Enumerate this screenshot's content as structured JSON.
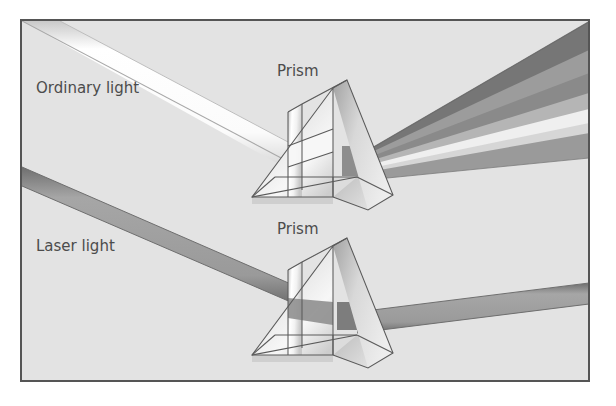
{
  "figure": {
    "title_visible": false,
    "domain_kind": "diagram",
    "background_color": "#ffffff",
    "panel_color": "#e3e3e3",
    "frame_color": "#555555",
    "frame": {
      "x": 21,
      "y": 20,
      "width": 568,
      "height": 361,
      "stroke_width": 2
    }
  },
  "labels": {
    "ordinary_light": {
      "text": "Ordinary light",
      "x": 36,
      "y": 93,
      "font_size": 15
    },
    "laser_light": {
      "text": "Laser light",
      "x": 36,
      "y": 251,
      "font_size": 15
    },
    "prism_top": {
      "text": "Prism",
      "x": 277,
      "y": 76,
      "font_size": 15
    },
    "prism_bottom": {
      "text": "Prism",
      "x": 277,
      "y": 234,
      "font_size": 15
    }
  },
  "colors": {
    "panel_bg": "#e3e3e3",
    "frame_stroke": "#555555",
    "label_text": "#4c4c4c",
    "incoming_white_beam": "#fdfdfd",
    "incoming_white_beam_edge": "#b9b9b9",
    "laser_beam": "#9a9a9a",
    "laser_beam_edge": "#6e6e6e",
    "laser_beam_dark": "#7d7d7d",
    "prism_outline": "#5a5a5a",
    "prism_face_light": "#f6f6f6",
    "prism_face_mid": "#d2d2d2",
    "prism_face_dark": "#a8a8a8",
    "prism_face_darker": "#8e8e8e"
  },
  "dispersed_rays": [
    {
      "name": "band-1",
      "color": "#767676",
      "label": "darkest band (top)"
    },
    {
      "name": "band-2",
      "color": "#9c9c9c",
      "label": "dark gray band"
    },
    {
      "name": "band-3",
      "color": "#8a8a8a",
      "label": "mid-dark gray band"
    },
    {
      "name": "band-4",
      "color": "#b5b5b5",
      "label": "mid gray band"
    },
    {
      "name": "band-5",
      "color": "#efefef",
      "label": "light band"
    },
    {
      "name": "band-6",
      "color": "#d6d6d6",
      "label": "light-mid band"
    },
    {
      "name": "band-7",
      "color": "#9a9a9a",
      "label": "gray band (bottom)"
    }
  ],
  "beams": {
    "ordinary_incoming": {
      "name": "ordinary-light-incoming-beam",
      "description": "White collimated beam entering from upper-left corner toward the top prism"
    },
    "laser_incoming": {
      "name": "laser-light-incoming-beam",
      "description": "Single gray beam entering from the left edge toward the bottom prism"
    },
    "laser_outgoing": {
      "name": "laser-light-outgoing-beam",
      "description": "Single gray beam exiting the bottom prism to the right edge, undispersed"
    }
  }
}
